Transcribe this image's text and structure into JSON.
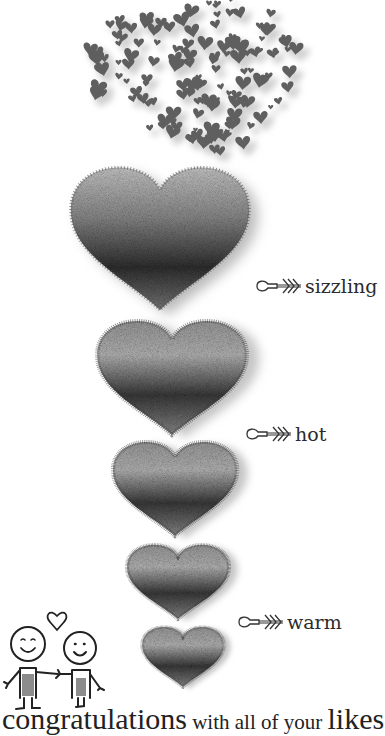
{
  "illustration": {
    "title_semantic": "heart thermometer of likes",
    "levels": [
      {
        "label": "sizzling"
      },
      {
        "label": "hot"
      },
      {
        "label": "warm"
      }
    ],
    "colors": {
      "heart_dark": "#2e2e2e",
      "heart_mid": "#6d6d6d",
      "heart_light": "#bdbdbd",
      "scatter_heart": "#5f5f5f",
      "ink": "#222222"
    }
  },
  "caption": {
    "part1": "congratulations",
    "part2": " with all of your ",
    "part3": "likes"
  }
}
